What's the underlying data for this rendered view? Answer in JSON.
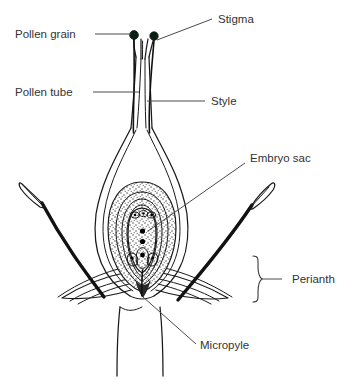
{
  "diagram": {
    "background_color": "#ffffff",
    "line_color": "#1a1a1a",
    "label_color": "#333333",
    "leader_color": "#4a4a4a",
    "pollen_color": "#0d1f14",
    "width": 347,
    "height": 383
  },
  "labels": {
    "pollen_grain": "Pollen grain",
    "pollen_tube": "Pollen tube",
    "stigma": "Stigma",
    "style": "Style",
    "embryo_sac": "Embryo sac",
    "perianth": "Perianth",
    "micropyle": "Micropyle"
  },
  "parts": [
    {
      "name": "pollen-grain",
      "label": "Pollen grain",
      "side": "left"
    },
    {
      "name": "pollen-tube",
      "label": "Pollen tube",
      "side": "left"
    },
    {
      "name": "stigma",
      "label": "Stigma",
      "side": "right"
    },
    {
      "name": "style",
      "label": "Style",
      "side": "right"
    },
    {
      "name": "embryo-sac",
      "label": "Embryo sac",
      "side": "right"
    },
    {
      "name": "perianth",
      "label": "Perianth",
      "side": "right"
    },
    {
      "name": "micropyle",
      "label": "Micropyle",
      "side": "right"
    }
  ],
  "structures": {
    "pollen_grain_count": 2,
    "antipodal_cell_count": 3,
    "polar_nuclei_count": 2,
    "synergid_count": 2,
    "egg_cell_count": 1,
    "stamen_count": 2
  }
}
